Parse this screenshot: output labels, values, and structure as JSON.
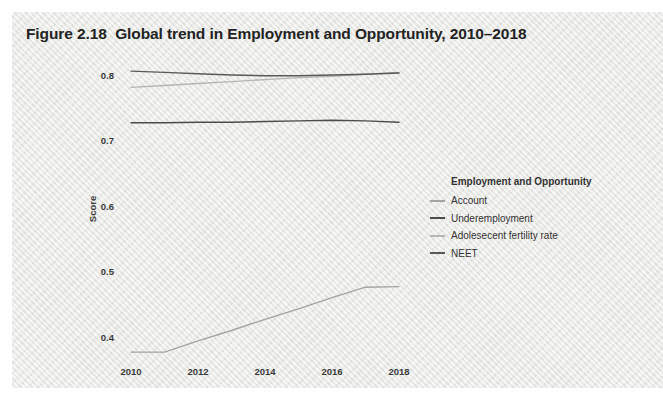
{
  "figure": {
    "title": "Figure 2.18  Global trend in Employment and Opportunity, 2010–2018"
  },
  "legend": {
    "title": "Employment and Opportunity",
    "position": "right",
    "items": [
      {
        "label": "Account",
        "color": "#a4a4a4"
      },
      {
        "label": "Underemployment",
        "color": "#4c4c4c"
      },
      {
        "label": "Adolesecent fertility rate",
        "color": "#b5b5b3"
      },
      {
        "label": "NEET",
        "color": "#595959"
      }
    ]
  },
  "chart_data": {
    "type": "line",
    "title": "Figure 2.18  Global trend in Employment and Opportunity, 2010–2018",
    "xlabel": "",
    "ylabel": "Score",
    "x": [
      2010,
      2011,
      2012,
      2013,
      2014,
      2015,
      2016,
      2017,
      2018
    ],
    "x_ticks": [
      2010,
      2012,
      2014,
      2016,
      2018
    ],
    "y_ticks": [
      0.8,
      0.7,
      0.6,
      0.5,
      0.4
    ],
    "xlim": [
      2010,
      2018
    ],
    "ylim": [
      0.4,
      0.8
    ],
    "grid": false,
    "frame": false,
    "legend_position": "right",
    "series": [
      {
        "name": "Account",
        "color": "#a4a4a4",
        "values": [
          0.377,
          0.377,
          0.394,
          0.41,
          0.427,
          0.443,
          0.46,
          0.476,
          0.477
        ]
      },
      {
        "name": "Underemployment",
        "color": "#4c4c4c",
        "values": [
          0.727,
          0.727,
          0.728,
          0.728,
          0.729,
          0.73,
          0.731,
          0.73,
          0.728
        ]
      },
      {
        "name": "Adolesecent fertility rate",
        "color": "#b5b5b3",
        "values": [
          0.781,
          0.784,
          0.787,
          0.79,
          0.793,
          0.796,
          0.798,
          0.801,
          0.804
        ]
      },
      {
        "name": "NEET",
        "color": "#595959",
        "values": [
          0.806,
          0.804,
          0.802,
          0.8,
          0.799,
          0.799,
          0.8,
          0.801,
          0.803
        ]
      }
    ]
  }
}
